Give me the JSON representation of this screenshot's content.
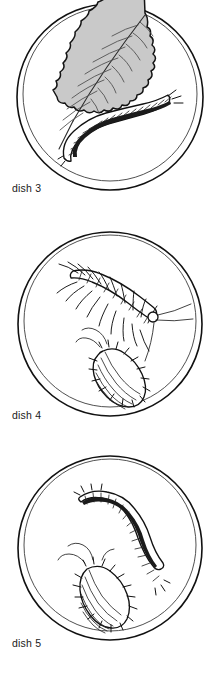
{
  "page": {
    "background_color": "#ffffff",
    "ink_color": "#111111",
    "label_color": "#1a1a1a"
  },
  "dishes": [
    {
      "id": "dish-3",
      "label": "dish 3",
      "contents": [
        {
          "name": "leaf",
          "description": "serrated gray leaf with veins",
          "fill_color": "#c9c9c9"
        },
        {
          "name": "caterpillar",
          "description": "segmented bristly caterpillar",
          "fill_color": "#ffffff"
        }
      ]
    },
    {
      "id": "dish-4",
      "label": "dish 4",
      "contents": [
        {
          "name": "centipede",
          "description": "many-legged centipede with long antennae",
          "fill_color": "#ffffff"
        },
        {
          "name": "woodlouse",
          "description": "segmented woodlouse",
          "fill_color": "#ffffff"
        }
      ]
    },
    {
      "id": "dish-5",
      "label": "dish 5",
      "contents": [
        {
          "name": "millipede",
          "description": "S-curved segmented millipede",
          "fill_color": "#ffffff"
        },
        {
          "name": "woodlouse",
          "description": "segmented woodlouse",
          "fill_color": "#ffffff"
        }
      ]
    }
  ]
}
